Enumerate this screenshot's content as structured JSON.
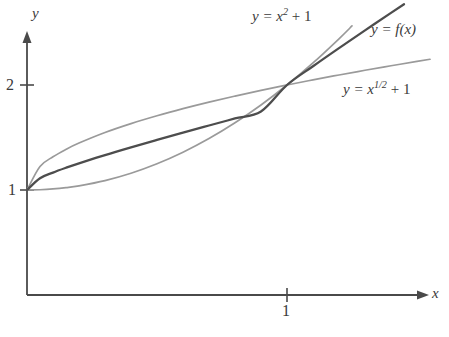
{
  "chart_data": {
    "type": "line",
    "title": "",
    "xlabel": "x",
    "ylabel": "y",
    "xlim": [
      0,
      1.62
    ],
    "ylim": [
      0,
      2.8
    ],
    "grid": false,
    "legend_position": "inline-annotations",
    "x_ticks": [
      {
        "value": 1,
        "label": "1"
      }
    ],
    "y_ticks": [
      {
        "value": 1,
        "label": "1"
      },
      {
        "value": 2,
        "label": "2"
      }
    ],
    "axes": {
      "x_axis_arrow": true,
      "y_axis_arrow": true,
      "x_axis_name": "x",
      "y_axis_name": "y"
    },
    "annotations": [
      {
        "id": "upper",
        "text": "y = x^(1/2) + 1"
      },
      {
        "id": "middle",
        "text": "y = f(x)"
      },
      {
        "id": "lower",
        "text": "y = x^2 + 1"
      }
    ],
    "intersection_point": {
      "x": 1,
      "y": 2
    },
    "common_start_point": {
      "x": 0,
      "y": 1
    },
    "series": [
      {
        "name": "y = x^{1/2} + 1",
        "formula": "x^0.5 + 1",
        "color": "#9a9a9a",
        "role": "upper-bound",
        "x": [
          0,
          0.05,
          0.1,
          0.15,
          0.2,
          0.3,
          0.4,
          0.5,
          0.6,
          0.7,
          0.8,
          0.9,
          1.0,
          1.1,
          1.2,
          1.3,
          1.4,
          1.5,
          1.55
        ],
        "values": [
          1.0,
          1.2236,
          1.3162,
          1.3873,
          1.4472,
          1.5477,
          1.6325,
          1.7071,
          1.7746,
          1.8367,
          1.8944,
          1.9487,
          2.0,
          2.0488,
          2.0954,
          2.1402,
          2.1833,
          2.2247,
          2.245
        ]
      },
      {
        "name": "y = f(x)",
        "formula": "squeezed function between bounds",
        "color": "#4d4d4d",
        "role": "squeezed",
        "x": [
          0,
          0.05,
          0.1,
          0.15,
          0.2,
          0.3,
          0.4,
          0.5,
          0.6,
          0.7,
          0.8,
          0.9,
          1.0,
          1.1,
          1.2,
          1.3,
          1.4,
          1.45
        ],
        "values": [
          1.0,
          1.1118,
          1.1661,
          1.2121,
          1.2544,
          1.3328,
          1.4065,
          1.4775,
          1.5466,
          1.6144,
          1.6811,
          1.7469,
          2.0,
          2.1788,
          2.3515,
          2.5205,
          2.6868,
          2.7695
        ]
      },
      {
        "name": "y = x^2 + 1",
        "formula": "x^2 + 1",
        "color": "#9a9a9a",
        "role": "lower-bound",
        "x": [
          0,
          0.05,
          0.1,
          0.15,
          0.2,
          0.3,
          0.4,
          0.5,
          0.6,
          0.7,
          0.8,
          0.9,
          1.0,
          1.1,
          1.2,
          1.25
        ],
        "values": [
          1.0,
          1.0025,
          1.01,
          1.0225,
          1.04,
          1.09,
          1.16,
          1.25,
          1.36,
          1.49,
          1.64,
          1.81,
          2.0,
          2.21,
          2.44,
          2.5625
        ]
      }
    ]
  },
  "labels": {
    "curve_lower_prefix": "y = x",
    "curve_lower_exponent": "2",
    "curve_lower_suffix": " + 1",
    "curve_middle": "y = f(x)",
    "curve_upper_prefix": "y = x",
    "curve_upper_exponent": "1/2",
    "curve_upper_suffix": " + 1",
    "axis_x": "x",
    "axis_y": "y",
    "tick_y_2": "2",
    "tick_y_1": "1",
    "tick_x_1": "1"
  },
  "colors": {
    "axis": "#4a4a4a",
    "curve_dark": "#4d4d4d",
    "curve_light": "#9a9a9a",
    "text": "#3a3a3a",
    "background": "#ffffff"
  }
}
